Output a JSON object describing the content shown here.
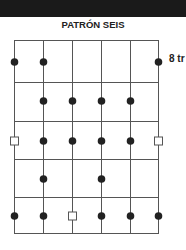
{
  "header": {
    "title": "PATRÓN SEIS"
  },
  "diagram": {
    "fret_label": "8 tr",
    "strings": 6,
    "frets": 5,
    "dots": [
      {
        "string": 1,
        "fret": 1
      },
      {
        "string": 2,
        "fret": 1
      },
      {
        "string": 6,
        "fret": 1
      },
      {
        "string": 2,
        "fret": 2
      },
      {
        "string": 3,
        "fret": 2
      },
      {
        "string": 4,
        "fret": 2
      },
      {
        "string": 5,
        "fret": 2
      },
      {
        "string": 2,
        "fret": 3
      },
      {
        "string": 3,
        "fret": 3
      },
      {
        "string": 4,
        "fret": 3
      },
      {
        "string": 5,
        "fret": 3
      },
      {
        "string": 2,
        "fret": 4
      },
      {
        "string": 4,
        "fret": 4
      },
      {
        "string": 1,
        "fret": 5
      },
      {
        "string": 2,
        "fret": 5
      },
      {
        "string": 4,
        "fret": 5
      },
      {
        "string": 5,
        "fret": 5
      },
      {
        "string": 6,
        "fret": 5
      }
    ],
    "roots": [
      {
        "string": 1,
        "fret": 3
      },
      {
        "string": 6,
        "fret": 3
      },
      {
        "string": 3,
        "fret": 5
      }
    ]
  }
}
